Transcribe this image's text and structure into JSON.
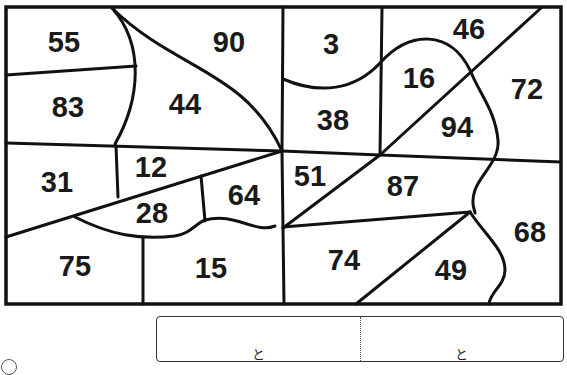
{
  "puzzle": {
    "regions": [
      {
        "label": "55",
        "x": 64,
        "y": 42
      },
      {
        "label": "90",
        "x": 229,
        "y": 42
      },
      {
        "label": "3",
        "x": 331,
        "y": 44
      },
      {
        "label": "46",
        "x": 469,
        "y": 29
      },
      {
        "label": "83",
        "x": 68,
        "y": 107
      },
      {
        "label": "44",
        "x": 185,
        "y": 104
      },
      {
        "label": "16",
        "x": 419,
        "y": 78
      },
      {
        "label": "72",
        "x": 527,
        "y": 89
      },
      {
        "label": "38",
        "x": 333,
        "y": 120
      },
      {
        "label": "94",
        "x": 457,
        "y": 127
      },
      {
        "label": "31",
        "x": 57,
        "y": 182
      },
      {
        "label": "12",
        "x": 151,
        "y": 167
      },
      {
        "label": "64",
        "x": 244,
        "y": 195
      },
      {
        "label": "51",
        "x": 310,
        "y": 176
      },
      {
        "label": "87",
        "x": 403,
        "y": 186
      },
      {
        "label": "28",
        "x": 152,
        "y": 213
      },
      {
        "label": "68",
        "x": 530,
        "y": 232
      },
      {
        "label": "75",
        "x": 75,
        "y": 266
      },
      {
        "label": "15",
        "x": 211,
        "y": 268
      },
      {
        "label": "74",
        "x": 344,
        "y": 260
      },
      {
        "label": "49",
        "x": 451,
        "y": 270
      }
    ]
  },
  "answer": {
    "cells": [
      {
        "joiner": "と"
      },
      {
        "joiner": "と"
      }
    ]
  }
}
